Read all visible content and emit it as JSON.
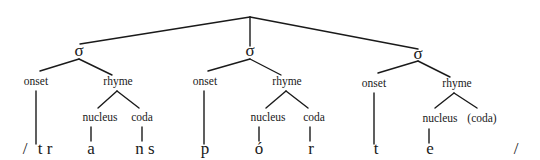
{
  "diagram": {
    "type": "syllable-structure-tree",
    "root_label": "",
    "syllables": [
      {
        "sigma": "σ",
        "onset": {
          "label": "onset",
          "segment": "t r"
        },
        "rhyme": {
          "label": "rhyme",
          "nucleus": {
            "label": "nucleus",
            "segment": "a"
          },
          "coda": {
            "label": "coda",
            "segment": "n s"
          }
        }
      },
      {
        "sigma": "σ",
        "onset": {
          "label": "onset",
          "segment": "p"
        },
        "rhyme": {
          "label": "rhyme",
          "nucleus": {
            "label": "nucleus",
            "segment": "ó"
          },
          "coda": {
            "label": "coda",
            "segment": "r"
          }
        }
      },
      {
        "sigma": "σ",
        "onset": {
          "label": "onset",
          "segment": "t"
        },
        "rhyme": {
          "label": "rhyme",
          "nucleus": {
            "label": "nucleus",
            "segment": "e"
          },
          "coda": {
            "label": "(coda)",
            "segment": ""
          }
        }
      }
    ],
    "brackets": {
      "open": "/",
      "close": "/"
    },
    "line_color": "#1a1a1a"
  }
}
